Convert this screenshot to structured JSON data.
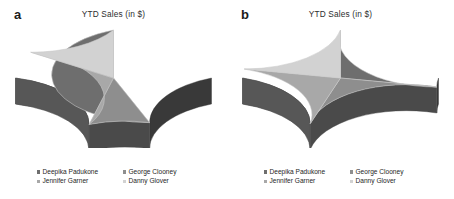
{
  "figure": {
    "background": "#ffffff",
    "panels": [
      {
        "letter": "a",
        "title": "YTD Sales (in $)"
      },
      {
        "letter": "b",
        "title": "YTD Sales (in $)"
      }
    ]
  },
  "legend": {
    "entries": [
      {
        "label": "Deepika Padukone",
        "color": "#6e6e6e"
      },
      {
        "label": "George Clooney",
        "color": "#8e8e8e"
      },
      {
        "label": "Jennifer Garner",
        "color": "#a8a8a8"
      },
      {
        "label": "Danny Glover",
        "color": "#d2d2d2"
      }
    ]
  },
  "palette": {
    "slice_deepika": "#6e6e6e",
    "slice_george": "#8e8e8e",
    "slice_jennifer": "#a8a8a8",
    "slice_danny": "#d2d2d2",
    "side_deepika": "#333333",
    "side_george": "#4d4d4d",
    "side_jennifer": "#5e5e5e",
    "side_danny": "#8a8a8a",
    "divider": "#c9c9c9",
    "text": "#262626"
  },
  "chart_data": [
    {
      "type": "pie",
      "title": "YTD Sales (in $)",
      "panel": "a",
      "categories": [
        "Deepika Padukone",
        "George Clooney",
        "Jennifer Garner",
        "Danny Glover"
      ],
      "values": [
        44,
        10,
        30,
        16
      ],
      "units": "percent",
      "colors": [
        "#6e6e6e",
        "#8e8e8e",
        "#a8a8a8",
        "#d2d2d2"
      ],
      "legend_position": "bottom",
      "three_d": true,
      "start_angle_deg": 90,
      "direction": "clockwise",
      "xlabel": "",
      "ylabel": ""
    },
    {
      "type": "pie",
      "title": "YTD Sales (in $)",
      "panel": "b",
      "categories": [
        "Deepika Padukone",
        "George Clooney",
        "Jennifer Garner",
        "Danny Glover"
      ],
      "values": [
        28,
        27,
        23,
        22
      ],
      "units": "percent",
      "colors": [
        "#6e6e6e",
        "#8e8e8e",
        "#a8a8a8",
        "#d2d2d2"
      ],
      "legend_position": "bottom",
      "three_d": true,
      "start_angle_deg": 90,
      "direction": "clockwise",
      "xlabel": "",
      "ylabel": ""
    }
  ]
}
